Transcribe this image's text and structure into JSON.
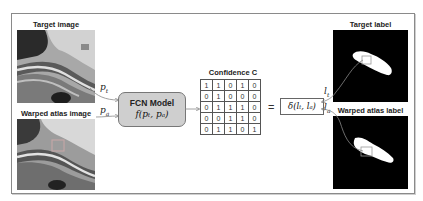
{
  "left_panel": {
    "target_image_label": "Target image",
    "warped_atlas_image_label": "Warped atlas image",
    "patch_target_symbol": "p",
    "patch_target_sub": "t",
    "patch_atlas_symbol": "p",
    "patch_atlas_sub": "a"
  },
  "model": {
    "title": "FCN Model",
    "formula": "f(pₜ, pₐ)",
    "fill_color": "#cfcfcf"
  },
  "confidence": {
    "title": "Confidence C",
    "matrix": [
      [
        "1",
        "1",
        "0",
        "1",
        "0"
      ],
      [
        "0",
        "1",
        "0",
        "0",
        "0"
      ],
      [
        "0",
        "1",
        "1",
        "1",
        "0"
      ],
      [
        "0",
        "0",
        "1",
        "1",
        "0"
      ],
      [
        "0",
        "1",
        "1",
        "0",
        "1"
      ]
    ]
  },
  "equation": {
    "equals": "=",
    "delta": "δ(lₜ, lₐ)"
  },
  "right_panel": {
    "target_label_title": "Target label",
    "warped_atlas_label_title": "Warped atlas label",
    "label_target_symbol": "l",
    "label_target_sub": "t",
    "label_atlas_symbol": "l",
    "label_atlas_sub": "a"
  }
}
